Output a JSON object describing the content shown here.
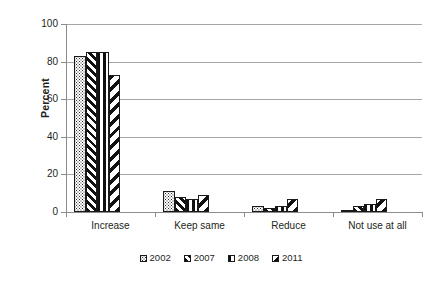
{
  "chart_data": {
    "type": "bar",
    "title": "",
    "xlabel": "",
    "ylabel": "Percent",
    "ylim": [
      0,
      100
    ],
    "yticks": [
      0,
      20,
      40,
      60,
      80,
      100
    ],
    "grid": true,
    "legend_position": "bottom",
    "categories": [
      "Increase",
      "Keep same",
      "Reduce",
      "Not use at all"
    ],
    "series": [
      {
        "name": "2002",
        "pattern": "stipple",
        "values": [
          83,
          11,
          3,
          1
        ]
      },
      {
        "name": "2007",
        "pattern": "diagonal-forward",
        "values": [
          85,
          8,
          2,
          3
        ]
      },
      {
        "name": "2008",
        "pattern": "vertical-lines",
        "values": [
          85,
          7,
          3,
          4
        ]
      },
      {
        "name": "2011",
        "pattern": "diagonal-back",
        "values": [
          73,
          9,
          7,
          7
        ]
      }
    ]
  },
  "axis": {
    "y_title": "Percent",
    "y_tick_labels": [
      "100",
      "80",
      "60",
      "40",
      "20",
      "0"
    ]
  },
  "legend": {
    "items": [
      {
        "label": "2002"
      },
      {
        "label": "2007"
      },
      {
        "label": "2008"
      },
      {
        "label": "2011"
      }
    ]
  },
  "colors": {
    "gridline": "#a6a6a6",
    "axis": "#8c8c8c",
    "ink": "#231f20",
    "background": "#ffffff"
  }
}
